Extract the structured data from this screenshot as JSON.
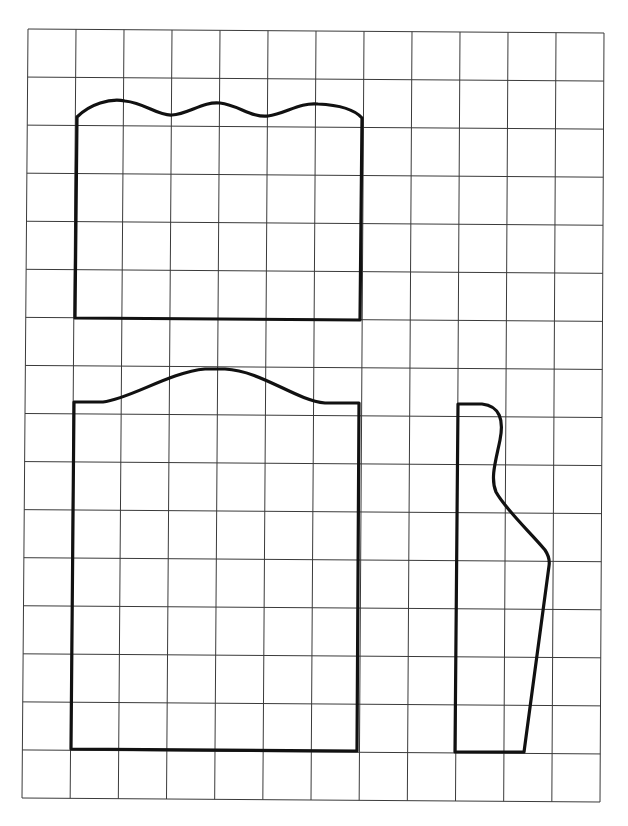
{
  "diagram": {
    "type": "sewing-pattern-grid",
    "grid": {
      "columns": 12,
      "rows": 16,
      "line_color": "#3a3a3a"
    },
    "pieces": [
      {
        "id": "piece-1",
        "name": "upper-rectangle-with-wavy-top",
        "description": "Rectangle panel with a scalloped (three-wave) top edge"
      },
      {
        "id": "piece-2",
        "name": "lower-rectangle-with-domed-top",
        "description": "Tall rectangle panel with a single domed top edge"
      },
      {
        "id": "piece-3",
        "name": "sleeve-profile",
        "description": "Narrow piece with curved top and tapered outer edge"
      }
    ],
    "outline_color": "#111111"
  }
}
